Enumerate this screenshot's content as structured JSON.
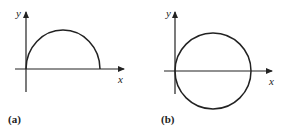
{
  "figure": {
    "panels": [
      {
        "id": "a",
        "caption": "(a)",
        "x_label": "x",
        "y_label": "y",
        "curve": "upper semicircle tangent to y-axis at origin",
        "origin_px": [
          26,
          69
        ],
        "radius_px": 37
      },
      {
        "id": "b",
        "caption": "(b)",
        "x_label": "x",
        "y_label": "y",
        "curve": "full circle tangent to y-axis at origin",
        "origin_px": [
          175,
          71
        ],
        "radius_px": 38
      }
    ],
    "colors": {
      "stroke": "#222222",
      "background": "#ffffff"
    }
  }
}
